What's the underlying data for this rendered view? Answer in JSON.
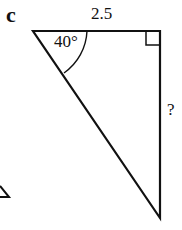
{
  "part_label": "c",
  "triangle": {
    "top_side": "2.5",
    "angle": "40°",
    "unknown_side": "?",
    "right_angle_at": "top-right"
  },
  "colors": {
    "stroke": "#111111",
    "background": "#ffffff"
  }
}
